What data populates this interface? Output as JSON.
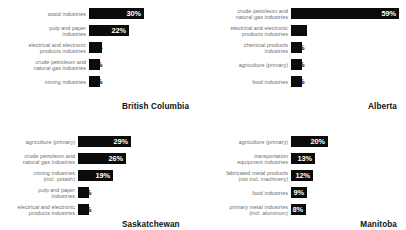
{
  "chart_data": {
    "type": "bar",
    "title": "",
    "xlabel": "",
    "ylabel": "",
    "orientation": "horizontal",
    "value_suffix": "%",
    "grid": false,
    "legend": "none",
    "xlim": [
      0,
      60
    ],
    "panels": [
      {
        "name": "British Columbia",
        "categories": [
          "wood industries",
          "pulp and paper\nindustries",
          "electrical and electronic\nproducts industries",
          "crude petroleum and\nnatural gas industries",
          "mining industries"
        ],
        "values": [
          30,
          22,
          7,
          6,
          6
        ],
        "labels": [
          "30%",
          "22%",
          "7%",
          "6%",
          "6%"
        ]
      },
      {
        "name": "Alberta",
        "categories": [
          "crude petroleum and\nnatural gas industries",
          "electrical and electronic\nproducts industries",
          "chemical products\nindustries",
          "agriculture (primary)",
          "food industries"
        ],
        "values": [
          59,
          9,
          6,
          5,
          4
        ],
        "labels": [
          "59%",
          "9%",
          "6%",
          "5%",
          "4%"
        ]
      },
      {
        "name": "Saskatchewan",
        "categories": [
          "agriculture (primary)",
          "crude petroleum and\nnatural gas industries",
          "mining industries\n(incl. potash)",
          "pulp and paper\nindustries",
          "electrical and electronic\nproducts industries"
        ],
        "values": [
          29,
          26,
          19,
          5,
          5
        ],
        "labels": [
          "29%",
          "26%",
          "19%",
          "5%",
          "5%"
        ]
      },
      {
        "name": "Manitoba",
        "categories": [
          "agriculture (primary)",
          "transportation\nequipment industries",
          "fabricated metal products\n(not incl. machinery)",
          "food industries",
          "primary metal industries\n(incl. aluminum)"
        ],
        "values": [
          20,
          13,
          12,
          9,
          8
        ],
        "labels": [
          "20%",
          "13%",
          "12%",
          "9%",
          "8%"
        ]
      }
    ],
    "colors": {
      "bar": "#0b0b0b",
      "bar_value_text": "#ffffff",
      "category_label": "#6e6e6e",
      "panel_title": "#111111",
      "background": "#ffffff"
    }
  }
}
